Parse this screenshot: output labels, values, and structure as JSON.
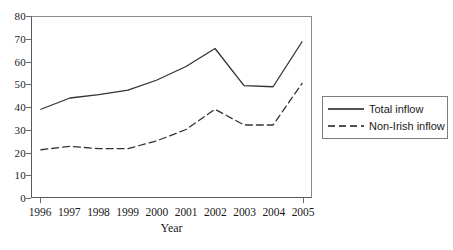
{
  "chart_data": {
    "type": "line",
    "title": "",
    "xlabel": "Year",
    "ylabel": "",
    "categories": [
      "1996",
      "1997",
      "1998",
      "1999",
      "2000",
      "2001",
      "2002",
      "2003",
      "2004",
      "2005"
    ],
    "x": [
      1996,
      1997,
      1998,
      1999,
      2000,
      2001,
      2002,
      2003,
      2004,
      2005
    ],
    "series": [
      {
        "name": "Total inflow",
        "style": "solid",
        "color": "#333333",
        "values": [
          39,
          44,
          45.5,
          47.5,
          52,
          58,
          66,
          49.5,
          49,
          69
        ]
      },
      {
        "name": "Non-Irish inflow",
        "style": "dashed",
        "color": "#333333",
        "values": [
          21,
          22.5,
          21.5,
          21.5,
          25,
          30,
          39,
          32,
          32,
          50.5
        ]
      }
    ],
    "ylim": [
      0,
      80
    ],
    "yticks": [
      0,
      10,
      20,
      30,
      40,
      50,
      60,
      70,
      80
    ],
    "ytick_labels": [
      "0",
      "10",
      "20",
      "30",
      "40",
      "50",
      "60",
      "70",
      "80"
    ],
    "grid": false,
    "legend_position": "right"
  },
  "legend": {
    "entries": [
      {
        "label": "Total inflow",
        "style": "solid"
      },
      {
        "label": "Non-Irish inflow",
        "style": "dashed"
      }
    ]
  },
  "axis": {
    "x_title": "Year"
  }
}
